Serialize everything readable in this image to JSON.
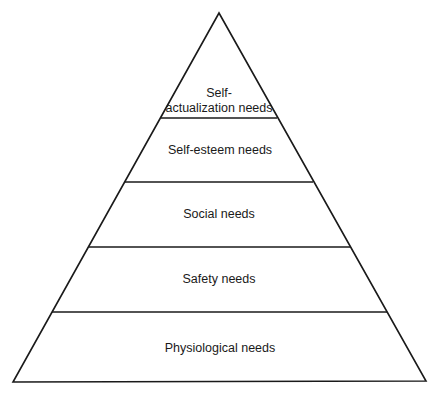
{
  "diagram": {
    "type": "pyramid",
    "levels": [
      {
        "label_line1": "Self-",
        "label_line2": "actualization needs"
      },
      {
        "label": "Self-esteem needs"
      },
      {
        "label": "Social needs"
      },
      {
        "label": "Safety needs"
      },
      {
        "label": "Physiological needs"
      }
    ],
    "colors": {
      "stroke": "#1a1a1a",
      "background": "#ffffff"
    }
  }
}
